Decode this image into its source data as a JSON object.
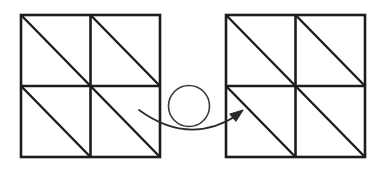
{
  "figure": {
    "name": "two-square-tiling-transformation-diagram",
    "background_color": "#ffffff",
    "stroke_color": "#1c1c1c",
    "thin_stroke_color": "#3a3a3a",
    "canvas": {
      "width": 380,
      "height": 176
    }
  },
  "left_shape": {
    "label": "left-square",
    "description": "2 by 2 grid of square cells, each cell split by a diagonal from its top-left corner to its bottom-right corner",
    "x": 21,
    "y": 15,
    "size": 139,
    "rows": 2,
    "cols": 2,
    "stroke_width": 2.6,
    "diagonal_stroke_width": 2.4,
    "cells": [
      {
        "name": "cell-top-left",
        "row": 0,
        "col": 0,
        "diagonal": "tl-br"
      },
      {
        "name": "cell-top-right",
        "row": 0,
        "col": 1,
        "diagonal": "tl-br"
      },
      {
        "name": "cell-bottom-left",
        "row": 1,
        "col": 0,
        "diagonal": "tl-br"
      },
      {
        "name": "cell-bottom-right",
        "row": 1,
        "col": 1,
        "diagonal": "tl-br"
      }
    ]
  },
  "right_shape": {
    "label": "right-square",
    "description": "2 by 2 grid of square cells, each cell split by a diagonal from its top-left corner to its bottom-right corner",
    "x": 226,
    "y": 15,
    "size": 139,
    "rows": 2,
    "cols": 2,
    "stroke_width": 2.6,
    "diagonal_stroke_width": 2.4,
    "cells": [
      {
        "name": "cell-top-left",
        "row": 0,
        "col": 0,
        "diagonal": "tl-br"
      },
      {
        "name": "cell-top-right",
        "row": 0,
        "col": 1,
        "diagonal": "tl-br"
      },
      {
        "name": "cell-bottom-left",
        "row": 1,
        "col": 0,
        "diagonal": "tl-br",
        "arrow_target": true
      },
      {
        "name": "cell-bottom-right",
        "row": 1,
        "col": 1,
        "diagonal": "tl-br"
      }
    ]
  },
  "circle_marker": {
    "label": "circle",
    "cx": 189,
    "cy": 106,
    "r": 20.5,
    "stroke_width": 1.6,
    "fill": "none"
  },
  "arrow": {
    "label": "curved-arrow",
    "direction": "left-to-right",
    "start_x": 139,
    "start_y": 110,
    "control_x": 190,
    "control_y": 147,
    "end_x": 239,
    "end_y": 114,
    "head_x": 243,
    "head_y": 111,
    "stroke_width": 1.7
  }
}
